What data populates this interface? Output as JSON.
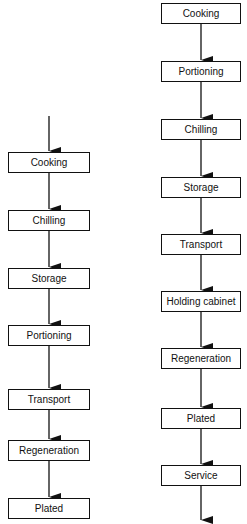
{
  "diagram": {
    "type": "flowchart",
    "flows": [
      {
        "name": "left-flow",
        "has_entry_arrow": true,
        "has_exit_arrow": false,
        "steps": [
          "Cooking",
          "Chilling",
          "Storage",
          "Portioning",
          "Transport",
          "Regeneration",
          "Plated"
        ]
      },
      {
        "name": "right-flow",
        "has_entry_arrow": false,
        "has_exit_arrow": true,
        "steps": [
          "Cooking",
          "Portioning",
          "Chilling",
          "Storage",
          "Transport",
          "Holding cabinet",
          "Regeneration",
          "Plated",
          "Service"
        ]
      }
    ]
  }
}
